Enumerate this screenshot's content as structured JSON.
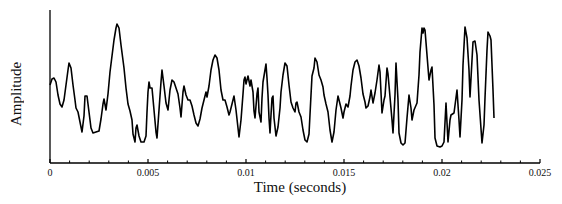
{
  "chart_data": {
    "type": "line",
    "title": "",
    "xlabel": "Time (seconds)",
    "ylabel": "Amplitude",
    "xlim": [
      0,
      0.025
    ],
    "ylim": [
      0,
      1
    ],
    "x_ticks": [
      0,
      0.005,
      0.01,
      0.015,
      0.02,
      0.025
    ],
    "x_tick_labels": [
      "0",
      "0.005",
      "0.01",
      "0.015",
      "0.02",
      "0.025"
    ],
    "minor_ticks_per_major": 5,
    "y_ticks": [],
    "grid": false,
    "legend": null,
    "series": [
      {
        "name": "waveform",
        "color": "#000000",
        "note": "amplitude normalized 0 (axis bottom) to 1 (axis top); signal spans t=0 to ~0.0227 s",
        "points_px": [
          [
            50,
            85
          ],
          [
            52,
            79
          ],
          [
            54,
            78
          ],
          [
            56,
            82
          ],
          [
            58,
            95
          ],
          [
            60,
            104
          ],
          [
            62,
            107
          ],
          [
            64,
            100
          ],
          [
            66,
            85
          ],
          [
            68,
            70
          ],
          [
            69,
            63
          ],
          [
            71,
            68
          ],
          [
            73,
            85
          ],
          [
            75,
            100
          ],
          [
            76,
            108
          ],
          [
            78,
            112
          ],
          [
            80,
            122
          ],
          [
            82,
            132
          ],
          [
            84,
            116
          ],
          [
            85,
            96
          ],
          [
            87,
            96
          ],
          [
            89,
            112
          ],
          [
            91,
            128
          ],
          [
            93,
            133
          ],
          [
            96,
            132
          ],
          [
            99,
            131
          ],
          [
            101,
            119
          ],
          [
            103,
            104
          ],
          [
            104,
            99
          ],
          [
            106,
            110
          ],
          [
            108,
            94
          ],
          [
            110,
            72
          ],
          [
            112,
            56
          ],
          [
            114,
            40
          ],
          [
            116,
            28
          ],
          [
            117,
            24
          ],
          [
            119,
            28
          ],
          [
            121,
            45
          ],
          [
            124,
            68
          ],
          [
            126,
            88
          ],
          [
            128,
            104
          ],
          [
            130,
            111
          ],
          [
            132,
            120
          ],
          [
            133,
            134
          ],
          [
            135,
            142
          ],
          [
            136,
            128
          ],
          [
            137,
            125
          ],
          [
            139,
            136
          ],
          [
            141,
            142
          ],
          [
            144,
            142
          ],
          [
            146,
            136
          ],
          [
            147,
            112
          ],
          [
            148,
            92
          ],
          [
            149,
            82
          ],
          [
            150,
            88
          ],
          [
            152,
            88
          ],
          [
            154,
            110
          ],
          [
            156,
            132
          ],
          [
            157,
            138
          ],
          [
            159,
            110
          ],
          [
            161,
            82
          ],
          [
            162,
            70
          ],
          [
            164,
            86
          ],
          [
            166,
            103
          ],
          [
            168,
            110
          ],
          [
            170,
            90
          ],
          [
            172,
            80
          ],
          [
            174,
            82
          ],
          [
            176,
            88
          ],
          [
            178,
            94
          ],
          [
            180,
            108
          ],
          [
            181,
            117
          ],
          [
            183,
            92
          ],
          [
            184,
            86
          ],
          [
            186,
            95
          ],
          [
            188,
            100
          ],
          [
            190,
            100
          ],
          [
            192,
            106
          ],
          [
            194,
            115
          ],
          [
            196,
            123
          ],
          [
            198,
            126
          ],
          [
            200,
            119
          ],
          [
            202,
            108
          ],
          [
            204,
            100
          ],
          [
            206,
            92
          ],
          [
            207,
            97
          ],
          [
            209,
            86
          ],
          [
            211,
            70
          ],
          [
            213,
            60
          ],
          [
            215,
            55
          ],
          [
            217,
            58
          ],
          [
            219,
            70
          ],
          [
            221,
            90
          ],
          [
            223,
            100
          ],
          [
            225,
            100
          ],
          [
            227,
            107
          ],
          [
            229,
            115
          ],
          [
            230,
            112
          ],
          [
            232,
            104
          ],
          [
            234,
            96
          ],
          [
            236,
            110
          ],
          [
            238,
            128
          ],
          [
            239,
            137
          ],
          [
            241,
            120
          ],
          [
            243,
            94
          ],
          [
            244,
            80
          ],
          [
            245,
            77
          ],
          [
            246,
            84
          ],
          [
            247,
            80
          ],
          [
            248,
            76
          ],
          [
            250,
            86
          ],
          [
            251,
            80
          ],
          [
            253,
            92
          ],
          [
            254,
            111
          ],
          [
            255,
            118
          ],
          [
            257,
            94
          ],
          [
            258,
            88
          ],
          [
            259,
            112
          ],
          [
            261,
            122
          ],
          [
            262,
            98
          ],
          [
            263,
            82
          ],
          [
            265,
            70
          ],
          [
            266,
            64
          ],
          [
            267,
            78
          ],
          [
            268,
            95
          ],
          [
            269,
            118
          ],
          [
            270,
            133
          ],
          [
            271,
            115
          ],
          [
            272,
            98
          ],
          [
            273,
            96
          ],
          [
            274,
            118
          ],
          [
            276,
            136
          ],
          [
            278,
            127
          ],
          [
            280,
            108
          ],
          [
            281,
            92
          ],
          [
            283,
            75
          ],
          [
            285,
            63
          ],
          [
            287,
            66
          ],
          [
            289,
            85
          ],
          [
            291,
            102
          ],
          [
            293,
            108
          ],
          [
            295,
            112
          ],
          [
            296,
            103
          ],
          [
            297,
            102
          ],
          [
            299,
            112
          ],
          [
            301,
            117
          ],
          [
            303,
            130
          ],
          [
            305,
            140
          ],
          [
            307,
            142
          ],
          [
            309,
            134
          ],
          [
            311,
            95
          ],
          [
            312,
            76
          ],
          [
            314,
            68
          ],
          [
            315,
            58
          ],
          [
            317,
            62
          ],
          [
            319,
            75
          ],
          [
            321,
            80
          ],
          [
            323,
            87
          ],
          [
            324,
            95
          ],
          [
            326,
            104
          ],
          [
            328,
            112
          ],
          [
            330,
            130
          ],
          [
            332,
            142
          ],
          [
            334,
            132
          ],
          [
            336,
            110
          ],
          [
            338,
            96
          ],
          [
            339,
            100
          ],
          [
            341,
            108
          ],
          [
            343,
            118
          ],
          [
            344,
            112
          ],
          [
            346,
            104
          ],
          [
            348,
            107
          ],
          [
            350,
            96
          ],
          [
            351,
            86
          ],
          [
            353,
            70
          ],
          [
            355,
            62
          ],
          [
            357,
            60
          ],
          [
            359,
            66
          ],
          [
            361,
            78
          ],
          [
            363,
            94
          ],
          [
            365,
            102
          ],
          [
            366,
            108
          ],
          [
            368,
            106
          ],
          [
            370,
            97
          ],
          [
            371,
            90
          ],
          [
            373,
            103
          ],
          [
            375,
            93
          ],
          [
            377,
            80
          ],
          [
            379,
            65
          ],
          [
            380,
            72
          ],
          [
            382,
            113
          ],
          [
            384,
            100
          ],
          [
            385,
            96
          ],
          [
            387,
            68
          ],
          [
            388,
            74
          ],
          [
            390,
            97
          ],
          [
            392,
            120
          ],
          [
            393,
            133
          ],
          [
            395,
            95
          ],
          [
            396,
            63
          ],
          [
            398,
            100
          ],
          [
            399,
            133
          ],
          [
            401,
            143
          ],
          [
            403,
            145
          ],
          [
            405,
            143
          ],
          [
            407,
            118
          ],
          [
            409,
            95
          ],
          [
            411,
            108
          ],
          [
            412,
            120
          ],
          [
            414,
            110
          ],
          [
            417,
            103
          ],
          [
            419,
            75
          ],
          [
            420,
            52
          ],
          [
            422,
            28
          ],
          [
            423,
            33
          ],
          [
            424,
            28
          ],
          [
            425,
            30
          ],
          [
            427,
            55
          ],
          [
            429,
            80
          ],
          [
            431,
            70
          ],
          [
            432,
            67
          ],
          [
            434,
            105
          ],
          [
            435,
            138
          ],
          [
            437,
            146
          ],
          [
            440,
            147
          ],
          [
            442,
            146
          ],
          [
            444,
            142
          ],
          [
            446,
            103
          ],
          [
            448,
            142
          ],
          [
            450,
            120
          ],
          [
            451,
            115
          ],
          [
            454,
            113
          ],
          [
            457,
            90
          ],
          [
            459,
            120
          ],
          [
            460,
            137
          ],
          [
            462,
            100
          ],
          [
            463,
            65
          ],
          [
            465,
            27
          ],
          [
            467,
            38
          ],
          [
            469,
            70
          ],
          [
            470,
            97
          ],
          [
            472,
            60
          ],
          [
            473,
            42
          ],
          [
            475,
            41
          ],
          [
            477,
            55
          ],
          [
            479,
            100
          ],
          [
            482,
            143
          ],
          [
            484,
            125
          ],
          [
            485,
            98
          ],
          [
            487,
            50
          ],
          [
            488,
            32
          ],
          [
            490,
            36
          ],
          [
            491,
            40
          ],
          [
            493,
            90
          ],
          [
            494,
            118
          ]
        ]
      }
    ]
  },
  "axes": {
    "plot_left_px": 50,
    "plot_right_px": 540,
    "plot_top_px": 10,
    "plot_bottom_px": 163
  }
}
